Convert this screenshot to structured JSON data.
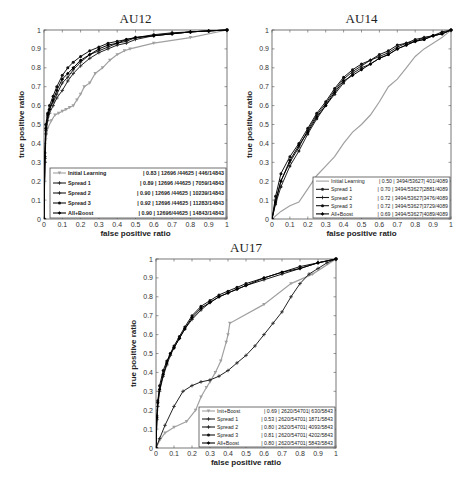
{
  "chart_data": [
    {
      "type": "line",
      "title": "AU12",
      "xlabel": "false positive ratio",
      "ylabel": "true positive ratio",
      "xlim": [
        0,
        1
      ],
      "ylim": [
        0,
        1
      ],
      "xticks": [
        "0",
        "0.1",
        "0.2",
        "0.3",
        "0.4",
        "0.5",
        "0.6",
        "0.7",
        "0.8",
        "0.9",
        "1"
      ],
      "yticks": [
        "0",
        "0.1",
        "0.2",
        "0.3",
        "0.4",
        "0.5",
        "0.6",
        "0.7",
        "0.8",
        "0.9",
        "1"
      ],
      "grid": false,
      "legend_position": "lower right",
      "legend_bold": true,
      "series": [
        {
          "name": "Initial Learning",
          "stats": "| 0.83 | 12696 /44625 |    446/14843",
          "color": "#a0a0a0",
          "marker": "triangle",
          "x": [
            0,
            0.005,
            0.01,
            0.02,
            0.04,
            0.06,
            0.08,
            0.1,
            0.12,
            0.14,
            0.16,
            0.18,
            0.2,
            0.22,
            0.25,
            0.28,
            0.32,
            0.36,
            0.4,
            0.44,
            0.47,
            0.6,
            0.8,
            1.0
          ],
          "y": [
            0,
            0.3,
            0.42,
            0.48,
            0.52,
            0.55,
            0.56,
            0.57,
            0.58,
            0.59,
            0.6,
            0.63,
            0.66,
            0.7,
            0.72,
            0.77,
            0.8,
            0.84,
            0.87,
            0.89,
            0.9,
            0.93,
            0.96,
            1.0
          ]
        },
        {
          "name": "Spread 1",
          "stats": "| 0.89 | 12696 /44625 |   7059/14843",
          "color": "#222222",
          "marker": "plus",
          "x": [
            0,
            0.005,
            0.01,
            0.02,
            0.03,
            0.05,
            0.07,
            0.1,
            0.13,
            0.16,
            0.2,
            0.25,
            0.3,
            0.35,
            0.4,
            0.45,
            0.5,
            0.6,
            0.7,
            0.8,
            0.9,
            1.0
          ],
          "y": [
            0,
            0.3,
            0.45,
            0.52,
            0.56,
            0.6,
            0.64,
            0.68,
            0.73,
            0.77,
            0.81,
            0.85,
            0.88,
            0.9,
            0.92,
            0.93,
            0.95,
            0.97,
            0.98,
            0.99,
            0.995,
            1.0
          ]
        },
        {
          "name": "Spread 2",
          "stats": "| 0.90 | 12696 /44625 | 10239/14843",
          "color": "#1a1a1a",
          "marker": "plus",
          "x": [
            0,
            0.005,
            0.01,
            0.02,
            0.03,
            0.05,
            0.07,
            0.1,
            0.13,
            0.16,
            0.2,
            0.25,
            0.3,
            0.35,
            0.4,
            0.45,
            0.5,
            0.6,
            0.7,
            0.8,
            0.9,
            1.0
          ],
          "y": [
            0,
            0.32,
            0.47,
            0.54,
            0.58,
            0.62,
            0.66,
            0.72,
            0.75,
            0.79,
            0.83,
            0.87,
            0.89,
            0.91,
            0.93,
            0.94,
            0.96,
            0.97,
            0.98,
            0.99,
            0.995,
            1.0
          ]
        },
        {
          "name": "Spread 3",
          "stats": "| 0.92 | 12696 /44625 | 11283/14843",
          "color": "#111111",
          "marker": "dot",
          "x": [
            0,
            0.005,
            0.01,
            0.02,
            0.03,
            0.05,
            0.07,
            0.1,
            0.13,
            0.16,
            0.2,
            0.25,
            0.3,
            0.35,
            0.4,
            0.45,
            0.5,
            0.6,
            0.7,
            0.8,
            0.9,
            1.0
          ],
          "y": [
            0,
            0.35,
            0.5,
            0.56,
            0.6,
            0.65,
            0.7,
            0.76,
            0.8,
            0.83,
            0.86,
            0.89,
            0.91,
            0.93,
            0.94,
            0.95,
            0.96,
            0.975,
            0.985,
            0.99,
            0.995,
            1.0
          ]
        },
        {
          "name": "All+Boost",
          "stats": "| 0.90 | 12696/44625 |   14843/14843",
          "color": "#000000",
          "marker": "diamond",
          "x": [
            0,
            0.005,
            0.01,
            0.02,
            0.03,
            0.05,
            0.07,
            0.1,
            0.13,
            0.16,
            0.2,
            0.25,
            0.3,
            0.35,
            0.4,
            0.45,
            0.5,
            0.6,
            0.7,
            0.8,
            0.9,
            1.0
          ],
          "y": [
            0,
            0.33,
            0.48,
            0.55,
            0.58,
            0.63,
            0.68,
            0.74,
            0.77,
            0.8,
            0.84,
            0.87,
            0.9,
            0.92,
            0.93,
            0.95,
            0.96,
            0.97,
            0.98,
            0.99,
            0.995,
            1.0
          ]
        }
      ]
    },
    {
      "type": "line",
      "title": "AU14",
      "xlabel": "false positive ratio",
      "ylabel": "true positive ratio",
      "xlim": [
        0,
        1
      ],
      "ylim": [
        0,
        1
      ],
      "xticks": [
        "0",
        "0.1",
        "0.2",
        "0.3",
        "0.4",
        "0.5",
        "0.6",
        "0.7",
        "0.8",
        "0.9",
        "1"
      ],
      "yticks": [
        "0",
        "0.1",
        "0.2",
        "0.3",
        "0.4",
        "0.5",
        "0.6",
        "0.7",
        "0.8",
        "0.9",
        "1"
      ],
      "grid": false,
      "legend_position": "lower right",
      "legend_bold": false,
      "series": [
        {
          "name": "Initial Learning",
          "stats": "| 0.50 | 3494/53627|  401/4089",
          "color": "#a0a0a0",
          "marker": "none",
          "x": [
            0,
            0.05,
            0.1,
            0.15,
            0.2,
            0.25,
            0.3,
            0.35,
            0.4,
            0.45,
            0.5,
            0.55,
            0.6,
            0.65,
            0.7,
            0.75,
            0.8,
            0.85,
            0.9,
            0.95,
            1.0
          ],
          "y": [
            0,
            0.04,
            0.07,
            0.09,
            0.16,
            0.23,
            0.28,
            0.33,
            0.4,
            0.46,
            0.5,
            0.55,
            0.62,
            0.7,
            0.74,
            0.8,
            0.86,
            0.9,
            0.93,
            0.96,
            1.0
          ]
        },
        {
          "name": "Spread 1",
          "stats": "| 0.70 | 3494/53627|2881/4089",
          "color": "#222222",
          "marker": "dot",
          "x": [
            0,
            0.02,
            0.05,
            0.1,
            0.15,
            0.2,
            0.25,
            0.3,
            0.35,
            0.4,
            0.45,
            0.5,
            0.55,
            0.6,
            0.65,
            0.7,
            0.75,
            0.8,
            0.85,
            0.9,
            0.95,
            1.0
          ],
          "y": [
            0,
            0.08,
            0.17,
            0.28,
            0.36,
            0.45,
            0.53,
            0.6,
            0.66,
            0.72,
            0.77,
            0.8,
            0.82,
            0.85,
            0.87,
            0.9,
            0.92,
            0.94,
            0.95,
            0.97,
            0.98,
            1.0
          ]
        },
        {
          "name": "Spread 2",
          "stats": "| 0.72 | 3494/53627|3476/4089",
          "color": "#1a1a1a",
          "marker": "plus",
          "x": [
            0,
            0.02,
            0.05,
            0.1,
            0.15,
            0.2,
            0.25,
            0.3,
            0.35,
            0.4,
            0.45,
            0.5,
            0.55,
            0.6,
            0.65,
            0.7,
            0.75,
            0.8,
            0.85,
            0.9,
            0.95,
            1.0
          ],
          "y": [
            0,
            0.1,
            0.2,
            0.3,
            0.38,
            0.47,
            0.55,
            0.61,
            0.68,
            0.74,
            0.78,
            0.81,
            0.84,
            0.86,
            0.88,
            0.91,
            0.93,
            0.94,
            0.96,
            0.97,
            0.98,
            1.0
          ]
        },
        {
          "name": "Spread 3",
          "stats": "| 0.72 | 3494/53627|3729/4089",
          "color": "#111111",
          "marker": "dot",
          "x": [
            0,
            0.02,
            0.05,
            0.1,
            0.15,
            0.2,
            0.25,
            0.3,
            0.35,
            0.4,
            0.45,
            0.5,
            0.55,
            0.6,
            0.65,
            0.7,
            0.75,
            0.8,
            0.85,
            0.9,
            0.95,
            1.0
          ],
          "y": [
            0,
            0.12,
            0.24,
            0.33,
            0.4,
            0.48,
            0.56,
            0.62,
            0.69,
            0.75,
            0.79,
            0.82,
            0.84,
            0.87,
            0.89,
            0.92,
            0.93,
            0.95,
            0.96,
            0.97,
            0.99,
            1.0
          ]
        },
        {
          "name": "All+Boost",
          "stats": "| 0.69 | 3494/53627|4089/4089",
          "color": "#000000",
          "marker": "diamond",
          "x": [
            0,
            0.02,
            0.05,
            0.1,
            0.15,
            0.2,
            0.25,
            0.3,
            0.35,
            0.4,
            0.45,
            0.5,
            0.55,
            0.6,
            0.65,
            0.7,
            0.75,
            0.8,
            0.85,
            0.9,
            0.95,
            1.0
          ],
          "y": [
            0,
            0.09,
            0.2,
            0.31,
            0.39,
            0.46,
            0.54,
            0.6,
            0.67,
            0.73,
            0.76,
            0.79,
            0.82,
            0.85,
            0.87,
            0.9,
            0.92,
            0.94,
            0.95,
            0.97,
            0.98,
            1.0
          ]
        }
      ]
    },
    {
      "type": "line",
      "title": "AU17",
      "xlabel": "false positive ratio",
      "ylabel": "true positive ratio",
      "xlim": [
        0,
        1
      ],
      "ylim": [
        0,
        1
      ],
      "xticks": [
        "0",
        "0.1",
        "0.2",
        "0.3",
        "0.4",
        "0.5",
        "0.6",
        "0.7",
        "0.8",
        "0.9",
        "1"
      ],
      "yticks": [
        "0",
        "0.1",
        "0.2",
        "0.3",
        "0.4",
        "0.5",
        "0.6",
        "0.7",
        "0.8",
        "0.9",
        "1"
      ],
      "grid": false,
      "legend_position": "lower right",
      "legend_bold": false,
      "series": [
        {
          "name": "Init+Boost",
          "stats": "| 0.69 | 2620/54701|  630/5843",
          "color": "#a0a0a0",
          "marker": "triangle",
          "x": [
            0,
            0.02,
            0.05,
            0.1,
            0.17,
            0.22,
            0.25,
            0.28,
            0.3,
            0.33,
            0.36,
            0.39,
            0.4,
            0.41,
            0.6,
            0.75,
            0.87,
            1.0
          ],
          "y": [
            0,
            0.04,
            0.08,
            0.11,
            0.14,
            0.2,
            0.27,
            0.32,
            0.35,
            0.4,
            0.46,
            0.56,
            0.6,
            0.66,
            0.76,
            0.87,
            0.92,
            1.0
          ]
        },
        {
          "name": "Spread 1",
          "stats": "| 0.53 | 2620/54701| 1871/5843",
          "color": "#222222",
          "marker": "plus",
          "x": [
            0,
            0.02,
            0.05,
            0.1,
            0.15,
            0.2,
            0.25,
            0.3,
            0.35,
            0.4,
            0.45,
            0.5,
            0.55,
            0.6,
            0.65,
            0.7,
            0.75,
            0.8,
            0.85,
            0.9,
            0.95,
            1.0
          ],
          "y": [
            0,
            0.05,
            0.12,
            0.22,
            0.3,
            0.33,
            0.35,
            0.36,
            0.38,
            0.41,
            0.45,
            0.49,
            0.54,
            0.6,
            0.66,
            0.72,
            0.8,
            0.87,
            0.92,
            0.95,
            0.98,
            1.0
          ]
        },
        {
          "name": "Spread 2",
          "stats": "| 0.80 | 2620/54701| 4093/5843",
          "color": "#1a1a1a",
          "marker": "plus",
          "x": [
            0,
            0.005,
            0.01,
            0.02,
            0.04,
            0.06,
            0.08,
            0.1,
            0.13,
            0.16,
            0.2,
            0.25,
            0.3,
            0.35,
            0.4,
            0.45,
            0.5,
            0.6,
            0.7,
            0.8,
            0.9,
            1.0
          ],
          "y": [
            0,
            0.15,
            0.22,
            0.3,
            0.38,
            0.44,
            0.49,
            0.53,
            0.58,
            0.63,
            0.68,
            0.73,
            0.77,
            0.8,
            0.82,
            0.84,
            0.86,
            0.89,
            0.92,
            0.95,
            0.98,
            1.0
          ]
        },
        {
          "name": "Spread 3",
          "stats": "| 0.81 | 2620/54701| 4202/5843",
          "color": "#111111",
          "marker": "dot",
          "x": [
            0,
            0.005,
            0.01,
            0.02,
            0.04,
            0.06,
            0.08,
            0.1,
            0.13,
            0.16,
            0.2,
            0.25,
            0.3,
            0.35,
            0.4,
            0.45,
            0.5,
            0.6,
            0.7,
            0.8,
            0.9,
            1.0
          ],
          "y": [
            0,
            0.17,
            0.25,
            0.33,
            0.41,
            0.46,
            0.5,
            0.54,
            0.59,
            0.64,
            0.7,
            0.75,
            0.78,
            0.81,
            0.83,
            0.85,
            0.87,
            0.9,
            0.93,
            0.96,
            0.98,
            1.0
          ]
        },
        {
          "name": "All+Boost",
          "stats": "| 0.80 | 2620/54701| 5843/5843",
          "color": "#000000",
          "marker": "diamond",
          "x": [
            0,
            0.005,
            0.01,
            0.02,
            0.04,
            0.06,
            0.08,
            0.1,
            0.13,
            0.16,
            0.2,
            0.25,
            0.3,
            0.35,
            0.4,
            0.45,
            0.5,
            0.6,
            0.7,
            0.8,
            0.9,
            1.0
          ],
          "y": [
            0,
            0.16,
            0.24,
            0.31,
            0.39,
            0.45,
            0.5,
            0.53,
            0.58,
            0.63,
            0.69,
            0.74,
            0.77,
            0.8,
            0.82,
            0.84,
            0.86,
            0.9,
            0.93,
            0.95,
            0.98,
            1.0
          ]
        }
      ]
    }
  ],
  "panels": [
    {
      "id": "au12",
      "plot": {
        "left": 44,
        "top": 30,
        "right": 227,
        "bottom": 219
      },
      "legend": {
        "left": 50,
        "top": 168,
        "right": 226,
        "bottom": 218
      }
    },
    {
      "id": "au14",
      "plot": {
        "left": 272,
        "top": 30,
        "right": 451,
        "bottom": 219
      },
      "legend": {
        "left": 313,
        "top": 177,
        "right": 450,
        "bottom": 218
      }
    },
    {
      "id": "au17",
      "plot": {
        "left": 156,
        "top": 259,
        "right": 336,
        "bottom": 448
      },
      "legend": {
        "left": 199,
        "top": 407,
        "right": 335,
        "bottom": 447
      }
    }
  ]
}
